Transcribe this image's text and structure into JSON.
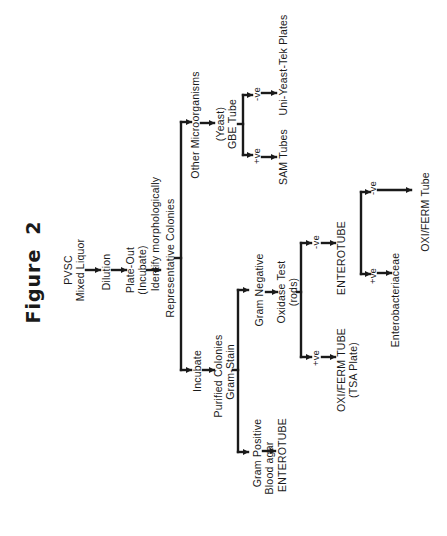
{
  "figure": {
    "title": "Figure",
    "number": "2",
    "ink_color": "#1a1a1a",
    "background": "#ffffff"
  },
  "flow": {
    "start": {
      "line1": "PVSC",
      "line2": "Mixed Liquor"
    },
    "dilution": "Dilution",
    "plate_out": {
      "line1": "Plate-Out",
      "line2": "(Incubate)"
    },
    "identify": "Identify morphologically",
    "representative": "Representative Colonies",
    "other_branch": {
      "label": "Other Microorganisms",
      "yeast": "(Yeast)",
      "gbe": "GBE Tube",
      "pos": "+ve",
      "neg": "-ve",
      "pos_result": "SAM  Tubes",
      "neg_result": "Uni-Yeast-Tek Plates"
    },
    "incubate_branch": {
      "label": "Incubate",
      "purified": "Purified Colonies",
      "gram_stain": "Gram-Stain",
      "gram_positive": {
        "label": "Gram Positive",
        "medium": "Blood agar",
        "result": "ENTEROTUBE"
      },
      "gram_negative": {
        "label": "Gram Negative",
        "oxidase": "Oxidase Test",
        "rods": "(rods)",
        "pos": "+ve",
        "neg": "-ve",
        "pos_result": "OXI/FERM TUBE",
        "pos_result_sub": "(TSA Plate)",
        "neg_result": "ENTEROTUBE",
        "entero_pos": "+ve",
        "entero_neg": "-ve",
        "entero_pos_result": "Enterobacteriaceae",
        "entero_neg_result": "OXI/FERM Tube"
      }
    }
  }
}
